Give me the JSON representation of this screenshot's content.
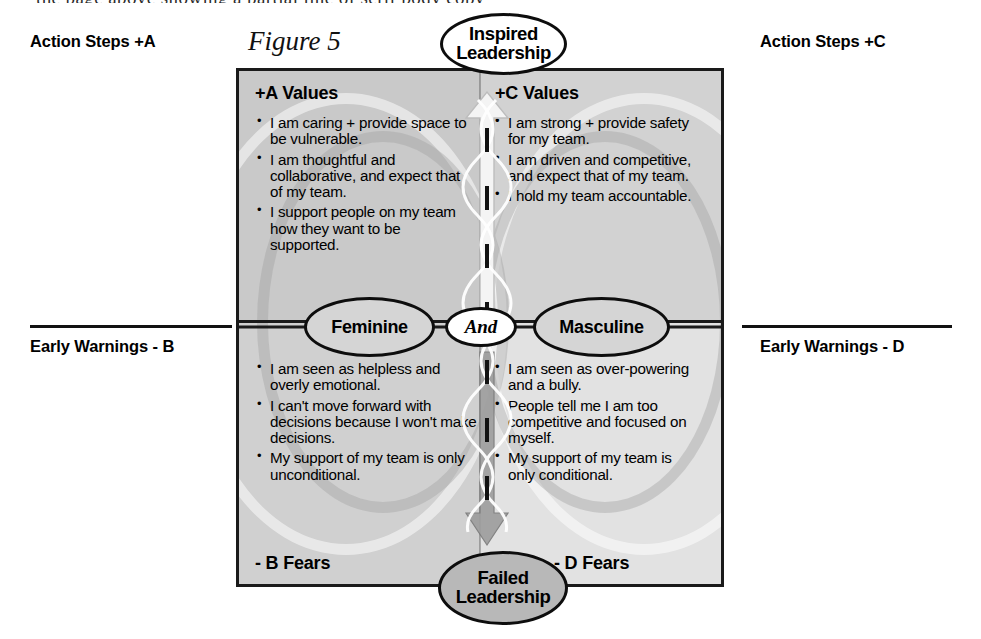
{
  "page": {
    "top_partial_line": "the page above showing a partial line of serif body copy",
    "figure_caption": "Figure 5"
  },
  "side_labels": {
    "top_left": "Action Steps +A",
    "top_right": "Action Steps +C",
    "bottom_left": "Early Warnings - B",
    "bottom_right": "Early Warnings - D"
  },
  "matrix": {
    "quadrants": {
      "top_left": {
        "header": "+A Values",
        "bullets": [
          "I am caring + provide space to be vulnerable.",
          "I am thoughtful and collaborative, and expect that of my team.",
          "I support people on my team how they want to be supported."
        ]
      },
      "top_right": {
        "header": "+C Values",
        "bullets": [
          "I am strong + provide safety for my team.",
          "I am driven and competitive, and expect that of my team.",
          "I hold my team accountable."
        ]
      },
      "bottom_left": {
        "footer": "- B Fears",
        "bullets": [
          "I am seen as helpless and overly emotional.",
          "I can't move forward with decisions because I won't make decisions.",
          "My support of my team is only unconditional."
        ]
      },
      "bottom_right": {
        "footer": "- D Fears",
        "bullets": [
          "I am seen as over-powering and a bully.",
          "People tell me I am too competitive and focused on myself.",
          "My support of my team is only conditional."
        ]
      }
    },
    "ovals": {
      "top": "Inspired Leadership",
      "bottom": "Failed Leadership",
      "left": "Feminine",
      "right": "Masculine",
      "center": "And"
    }
  },
  "colors": {
    "frame": "#1a1a1a",
    "quadrant_top_left": "#c9c9c9",
    "quadrant_top_right": "#d2d2d2",
    "quadrant_bottom_left": "#d0d0d0",
    "quadrant_bottom_right": "#e2e2e2",
    "oval_inspired_fill": "#ffffff",
    "oval_failed_fill": "#b8b8b8",
    "oval_gender_fill": "#d5d5d5",
    "up_arrow": "#f2f2f2",
    "down_arrow": "#9a9a9a"
  }
}
